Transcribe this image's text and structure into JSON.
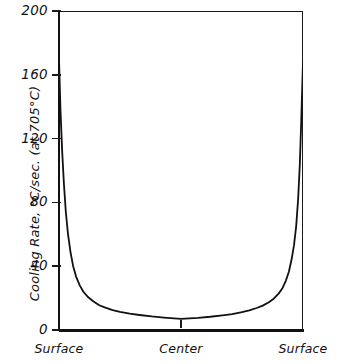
{
  "chart_data": {
    "type": "line",
    "title": "",
    "subtitle": "",
    "xlabel": "",
    "ylabel": "Cooling Rate, °C/sec. (at 705°C)",
    "ylim": [
      0,
      200
    ],
    "xlim": [
      0,
      1
    ],
    "grid": false,
    "legend": null,
    "ytick_labels": [
      "0",
      "40",
      "80",
      "120",
      "160",
      "200"
    ],
    "ytick_values": [
      0,
      40,
      80,
      120,
      160,
      200
    ],
    "xtick_labels": [
      "Surface",
      "Center",
      "Surface"
    ],
    "xtick_values": [
      0,
      0.5,
      1
    ],
    "series": [
      {
        "name": "Cooling rate across bar section",
        "x": [
          0.0,
          0.006,
          0.013,
          0.02,
          0.028,
          0.037,
          0.047,
          0.058,
          0.07,
          0.085,
          0.1,
          0.12,
          0.14,
          0.165,
          0.19,
          0.22,
          0.25,
          0.29,
          0.33,
          0.38,
          0.43,
          0.5,
          0.57,
          0.62,
          0.67,
          0.71,
          0.75,
          0.78,
          0.81,
          0.835,
          0.86,
          0.88,
          0.9,
          0.915,
          0.93,
          0.942,
          0.953,
          0.963,
          0.972,
          0.98,
          0.987,
          0.993,
          1.0
        ],
        "y": [
          170.0,
          138.0,
          112.0,
          92.0,
          74.0,
          60.0,
          49.0,
          40.0,
          33.5,
          28.0,
          24.0,
          20.5,
          18.0,
          15.5,
          14.0,
          12.5,
          11.3,
          10.2,
          9.4,
          8.5,
          7.8,
          7.0,
          7.6,
          8.3,
          9.2,
          10.0,
          11.2,
          12.3,
          13.8,
          15.3,
          17.4,
          19.6,
          22.8,
          26.0,
          31.0,
          36.5,
          44.0,
          53.0,
          65.0,
          82.0,
          104.0,
          132.0,
          168.0
        ]
      }
    ],
    "center_tick": true,
    "colors": {
      "curve": "#111111",
      "axis": "#1a1a1a",
      "background": "#ffffff"
    }
  },
  "axis": {
    "y_title": "Cooling Rate, °C/sec. (at 705°C)",
    "y_ticks": [
      {
        "label": "200",
        "value": 200
      },
      {
        "label": "160",
        "value": 160
      },
      {
        "label": "120",
        "value": 120
      },
      {
        "label": "80",
        "value": 80
      },
      {
        "label": "40",
        "value": 40
      },
      {
        "label": "0",
        "value": 0
      }
    ],
    "x_ticks": [
      {
        "label": "Surface",
        "value": 0
      },
      {
        "label": "Center",
        "value": 0.5
      },
      {
        "label": "Surface",
        "value": 1
      }
    ]
  }
}
